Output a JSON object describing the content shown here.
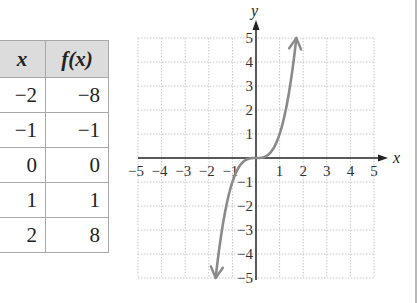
{
  "table": {
    "headers": [
      "x",
      "f(x)"
    ],
    "rows": [
      [
        "−2",
        "−8"
      ],
      [
        "−1",
        "−1"
      ],
      [
        "0",
        "0"
      ],
      [
        "1",
        "1"
      ],
      [
        "2",
        "8"
      ]
    ]
  },
  "graph": {
    "x_axis_label": "x",
    "y_axis_label": "y",
    "x_ticks": [
      "−5",
      "−4",
      "−3",
      "−2",
      "−1",
      "1",
      "2",
      "3",
      "4",
      "5"
    ],
    "y_ticks": [
      "5",
      "4",
      "3",
      "2",
      "1",
      "−1",
      "−2",
      "−3",
      "−4",
      "−5"
    ]
  },
  "colors": {
    "curve": "#8a8a8a",
    "grid": "#c8c8c8",
    "axis": "#222222",
    "header_bg": "#dcdcdc"
  },
  "chart_data": {
    "type": "line",
    "title": "",
    "function": "f(x) = x^3",
    "xlabel": "x",
    "ylabel": "y",
    "xlim": [
      -5,
      5
    ],
    "ylim": [
      -5,
      5
    ],
    "grid": true,
    "legend": null,
    "series": [
      {
        "name": "f(x) = x^3",
        "x": [
          -1.71,
          -1.5,
          -1,
          -0.5,
          0,
          0.5,
          1,
          1.5,
          1.71
        ],
        "y": [
          -5,
          -3.375,
          -1,
          -0.125,
          0,
          0.125,
          1,
          3.375,
          5
        ],
        "arrows_at_ends": true
      }
    ],
    "table": {
      "columns": [
        "x",
        "f(x)"
      ],
      "x": [
        -2,
        -1,
        0,
        1,
        2
      ],
      "fx": [
        -8,
        -1,
        0,
        1,
        8
      ]
    }
  }
}
